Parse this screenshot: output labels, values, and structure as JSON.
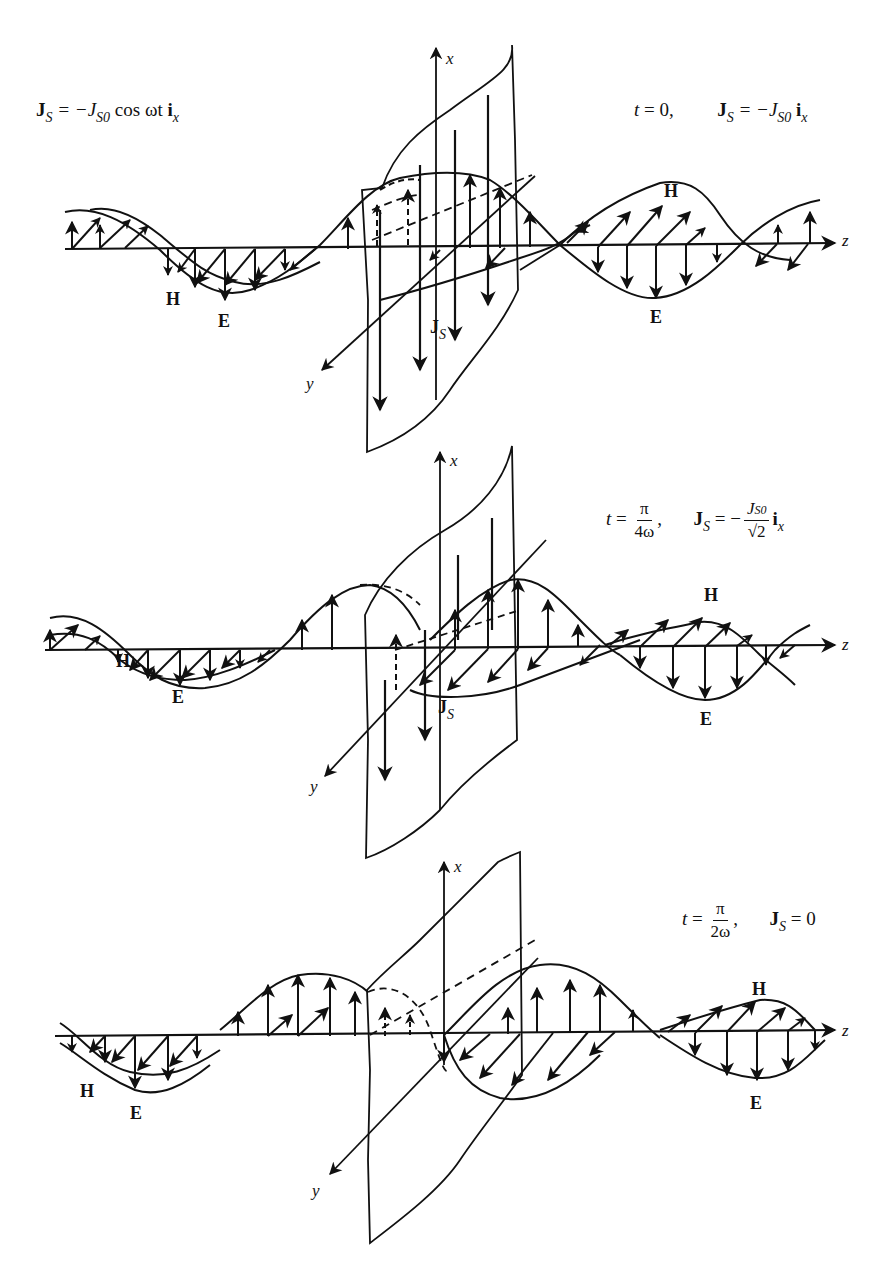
{
  "figure": {
    "axes": {
      "x": "x",
      "y": "y",
      "z": "z"
    },
    "field_labels": {
      "electric": "E",
      "magnetic": "H",
      "current": "J",
      "current_sub": "S"
    },
    "source_equation": {
      "lhs": "J",
      "lhs_sub": "S",
      "rhs_prefix": "= −J",
      "rhs_sub": "S0",
      "rhs_suffix": " cos ωt ",
      "unit_vec": "i",
      "unit_sub": "x"
    },
    "panels": [
      {
        "id": "t0",
        "time_label": {
          "prefix": "t",
          "eq": " = 0,",
          "frac_num": "",
          "frac_den": ""
        },
        "current_eq": {
          "lhs": "J",
          "lhs_sub": "S",
          "rhs": "= −J",
          "rhs_sub": "S0",
          "frac": false,
          "unit": "i",
          "unit_sub": "x"
        },
        "show_js_label": true
      },
      {
        "id": "t_pi_4w",
        "time_label": {
          "prefix": "t",
          "eq": " = ",
          "frac_num": "π",
          "frac_den": "4ω",
          "trail": ","
        },
        "current_eq": {
          "lhs": "J",
          "lhs_sub": "S",
          "rhs": "= −",
          "frac_num": "J",
          "frac_num_sub": "S0",
          "frac_den": "√2",
          "frac": true,
          "unit": "i",
          "unit_sub": "x"
        },
        "show_js_label": true
      },
      {
        "id": "t_pi_2w",
        "time_label": {
          "prefix": "t",
          "eq": " = ",
          "frac_num": "π",
          "frac_den": "2ω",
          "trail": ","
        },
        "current_eq": {
          "lhs": "J",
          "lhs_sub": "S",
          "rhs": "= 0",
          "frac": false
        },
        "show_js_label": false
      }
    ]
  }
}
